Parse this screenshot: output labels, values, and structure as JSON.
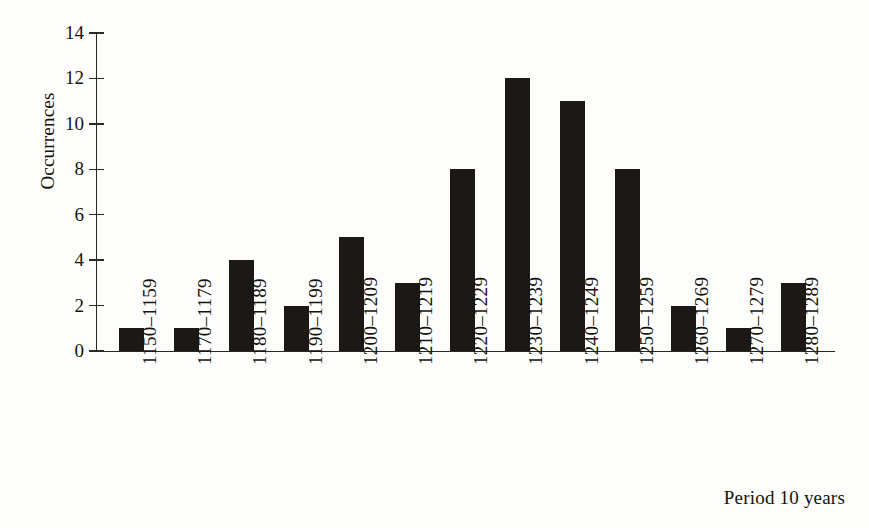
{
  "chart_data": {
    "type": "bar",
    "title": "",
    "subtitle": "",
    "xlabel": "Period 10 years",
    "ylabel": "Occurrences",
    "categories": [
      "1150–1159",
      "1170–1179",
      "1180–1189",
      "1190–1199",
      "1200–1209",
      "1210–1219",
      "1220–1229",
      "1230–1239",
      "1240–1249",
      "1250–1259",
      "1260–1269",
      "1270–1279",
      "1280–1289"
    ],
    "values": [
      1,
      1,
      4,
      2,
      5,
      3,
      8,
      12,
      11,
      8,
      2,
      1,
      3
    ],
    "ylim": [
      0,
      14
    ],
    "ytick_labels": [
      "0",
      "2",
      "4",
      "6",
      "8",
      "10",
      "12",
      "14"
    ],
    "ytick_values": [
      0,
      2,
      4,
      6,
      8,
      10,
      12,
      14
    ],
    "grid": false,
    "legend": false,
    "legend_position": "none",
    "bar_color": "#1b1815",
    "axis_color": "#2a2724",
    "background_color": "#fdfdfb"
  }
}
